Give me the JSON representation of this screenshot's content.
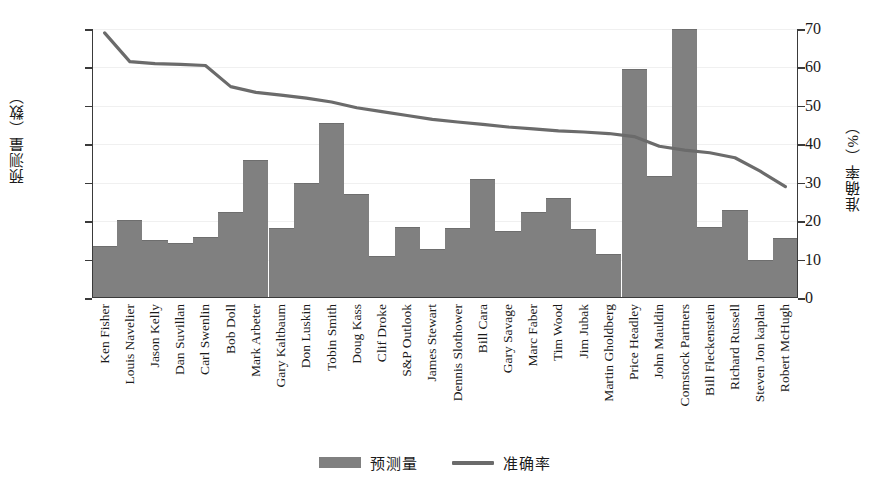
{
  "chart_data": {
    "type": "bar",
    "title": "",
    "xlabel": "",
    "ylabel": "预测量（数）",
    "ylabel_right": "准确率（%）",
    "ylim": [
      50,
      400
    ],
    "ylim_right": [
      0,
      70
    ],
    "yticks": [
      400,
      350,
      300,
      250,
      200,
      150,
      100,
      50
    ],
    "yticks_right": [
      70,
      60,
      50,
      40,
      30,
      20,
      10,
      0
    ],
    "grid": true,
    "legend_position": "bottom-center",
    "bar_color": "#808080",
    "line_color": "#6b6b6b",
    "categories": [
      "Ken Fisher",
      "Louis Navelier",
      "Jason Kelly",
      "Dan Suvillan",
      "Carl Swenlin",
      "Bob Doll",
      "Mark Arbeter",
      "Gary Kaltbaum",
      "Don Luskin",
      "Tobin Smith",
      "Doug Kass",
      "Clif Droke",
      "S&P Outlook",
      "James Stewart",
      "Dennis Slothower",
      "Bill Cara",
      "Gary Savage",
      "Marc Faber",
      "Tim Wood",
      "Jim Jubak",
      "Martin Gholdberg",
      "Price Headley",
      "John Mauldin",
      "Comstock Partners",
      "Bill Fleckenstein",
      "Richard Russell",
      "Steven Jon kaplan",
      "Robert McHugh"
    ],
    "series": [
      {
        "name": "预测量",
        "type": "bar",
        "axis": "left",
        "values": [
          118,
          151,
          126,
          121,
          130,
          162,
          229,
          141,
          200,
          278,
          185,
          105,
          143,
          114,
          141,
          205,
          137,
          162,
          180,
          140,
          107,
          348,
          209,
          400,
          143,
          165,
          100,
          128
        ]
      },
      {
        "name": "准确率",
        "type": "line",
        "axis": "right",
        "values": [
          69.0,
          61.5,
          61.0,
          60.8,
          60.5,
          55.0,
          53.5,
          52.8,
          52.0,
          51.0,
          49.5,
          48.5,
          47.5,
          46.5,
          45.8,
          45.2,
          44.5,
          44.0,
          43.5,
          43.2,
          42.8,
          42.0,
          39.5,
          38.5,
          37.8,
          36.5,
          33.0,
          29.0
        ]
      }
    ]
  },
  "legend": {
    "items": [
      {
        "label": "预测量",
        "marker": "bar-swatch"
      },
      {
        "label": "准确率",
        "marker": "line-swatch"
      }
    ]
  }
}
